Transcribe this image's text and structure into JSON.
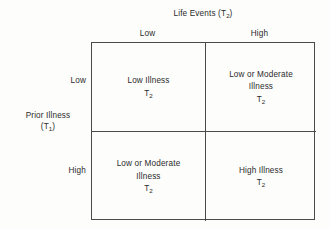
{
  "figure": {
    "type": "2x2-matrix-diagram",
    "column_axis": {
      "title_text": "Life Events (T",
      "title_subscript": "2",
      "title_suffix": ")",
      "headers": [
        "Low",
        "High"
      ]
    },
    "row_axis": {
      "title_line1": "Prior Illness",
      "title_line2_prefix": "(T",
      "title_line2_subscript": "1",
      "title_line2_suffix": ")",
      "headers": [
        "Low",
        "High"
      ]
    },
    "cells": {
      "top_left": {
        "line1": "Low Illness",
        "line2_prefix": "T",
        "line2_subscript": "2"
      },
      "top_right": {
        "line1": "Low or Moderate",
        "line2": "Illness",
        "line3_prefix": "T",
        "line3_subscript": "2"
      },
      "bottom_left": {
        "line1": "Low or Moderate",
        "line2": "Illness",
        "line3_prefix": "T",
        "line3_subscript": "2"
      },
      "bottom_right": {
        "line1": "High Illness",
        "line2_prefix": "T",
        "line2_subscript": "2"
      }
    },
    "style": {
      "line_color": "#4a4a4a",
      "background_color": "#fdfdfb",
      "text_color": "#2b2b2b"
    }
  }
}
